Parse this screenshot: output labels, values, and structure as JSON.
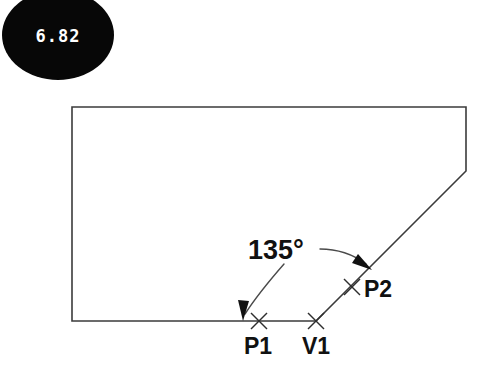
{
  "canvas": {
    "width": 493,
    "height": 376,
    "background": "#ffffff"
  },
  "badge": {
    "value": "6.82",
    "fill": "#070707",
    "text_color": "#ffffff",
    "center_x": 58,
    "center_y": 35,
    "radius_x": 56,
    "radius_y": 45
  },
  "diagram": {
    "title": "",
    "line_color": "#3b3b3b",
    "outline_points": "72,107 466,107 466,171 316,321 72,321 72,107",
    "annotation": {
      "angle_label": "135°",
      "angle_value": 135,
      "angle_units": "degrees",
      "label_x": 248,
      "label_y": 259
    },
    "points": [
      {
        "id": "P1",
        "label": "P1",
        "marker_x": 259,
        "marker_y": 321,
        "label_x": 244,
        "label_y": 354,
        "marker": "x-cross"
      },
      {
        "id": "V1",
        "label": "V1",
        "marker_x": 316,
        "marker_y": 321,
        "label_x": 302,
        "label_y": 354,
        "marker": "x-cross"
      },
      {
        "id": "P2",
        "label": "P2",
        "marker_x": 352,
        "marker_y": 287,
        "label_x": 364,
        "label_y": 297,
        "marker": "x-cross"
      }
    ],
    "leaders": [
      {
        "id": "leader-left",
        "from_x": 282,
        "from_y": 266,
        "to_x": 243,
        "to_y": 318,
        "arrow_at": "baseline"
      },
      {
        "id": "leader-right",
        "from_x": 322,
        "from_y": 250,
        "to_x": 367,
        "to_y": 266,
        "arrow_at": "diagonal"
      }
    ]
  }
}
